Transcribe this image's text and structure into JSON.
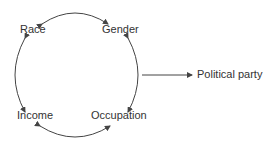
{
  "diagram": {
    "nodes": [
      {
        "id": "race",
        "label": "Race"
      },
      {
        "id": "gender",
        "label": "Gender"
      },
      {
        "id": "income",
        "label": "Income"
      },
      {
        "id": "occupation",
        "label": "Occupation"
      },
      {
        "id": "political_party",
        "label": "Political party"
      }
    ],
    "edges": [
      {
        "from": "race",
        "to": "gender",
        "type": "bidirectional-curved"
      },
      {
        "from": "gender",
        "to": "occupation",
        "type": "bidirectional-curved"
      },
      {
        "from": "occupation",
        "to": "income",
        "type": "bidirectional-curved"
      },
      {
        "from": "income",
        "to": "race",
        "type": "bidirectional-curved"
      },
      {
        "from": "cycle",
        "to": "political_party",
        "type": "directed-straight"
      }
    ],
    "colors": {
      "line": "#444444",
      "text": "#333333",
      "background": "#ffffff"
    }
  }
}
